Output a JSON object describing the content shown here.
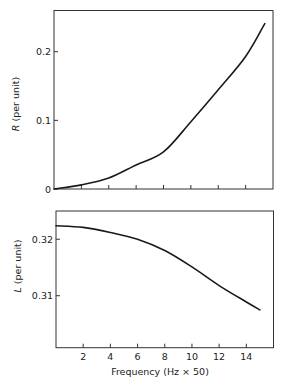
{
  "chart_data": [
    {
      "type": "line",
      "title": "",
      "xlabel": "",
      "ylabel": "R (per unit)",
      "ylabel_var": "R",
      "ylabel_unit": "(per unit)",
      "xlim": [
        0,
        16
      ],
      "ylim": [
        0,
        0.26
      ],
      "grid": false,
      "x_ticks": [
        2,
        4,
        6,
        8,
        10,
        12,
        14
      ],
      "x_tick_labels": [],
      "y_ticks": [
        0,
        0.1,
        0.2
      ],
      "y_tick_labels": [
        "0",
        "0.1",
        "0.2"
      ],
      "series": [
        {
          "name": "R",
          "x": [
            0,
            2,
            4,
            6,
            8,
            10,
            12,
            14,
            15.4
          ],
          "values": [
            0.0,
            0.006,
            0.016,
            0.035,
            0.054,
            0.098,
            0.1445,
            0.193,
            0.241
          ]
        }
      ]
    },
    {
      "type": "line",
      "title": "",
      "xlabel": "Frequency (Hz × 50)",
      "ylabel": "L (per unit)",
      "ylabel_var": "L",
      "ylabel_unit": "(per unit)",
      "xlim": [
        0,
        16
      ],
      "ylim": [
        0.3008,
        0.325
      ],
      "grid": false,
      "x_ticks": [
        2,
        4,
        6,
        8,
        10,
        12,
        14
      ],
      "x_tick_labels": [
        "2",
        "4",
        "6",
        "8",
        "10",
        "12",
        "14"
      ],
      "y_ticks": [
        0.31,
        0.32
      ],
      "y_tick_labels": [
        "0.31",
        "0.32"
      ],
      "series": [
        {
          "name": "L",
          "x": [
            0,
            2,
            4,
            6,
            8,
            10,
            12,
            14,
            15
          ],
          "values": [
            0.3224,
            0.3221,
            0.3212,
            0.32,
            0.318,
            0.3151,
            0.3118,
            0.3089,
            0.3075
          ]
        }
      ]
    }
  ],
  "labels": {
    "top_ylabel_var": "R",
    "top_ylabel_unit": " (per unit)",
    "bottom_ylabel_var": "L",
    "bottom_ylabel_unit": " (per unit)",
    "xlabel": "Frequency (Hz × 50)"
  }
}
